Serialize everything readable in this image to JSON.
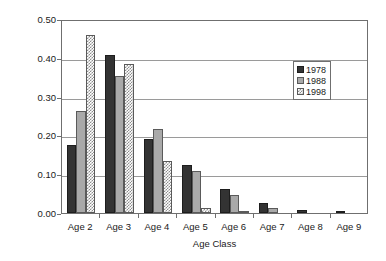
{
  "chart_data": {
    "type": "bar",
    "title": "",
    "xlabel": "Age Class",
    "ylabel": "Proportion",
    "categories": [
      "Age 2",
      "Age 3",
      "Age 4",
      "Age 5",
      "Age 6",
      "Age 7",
      "Age 8",
      "Age 9"
    ],
    "series": [
      {
        "name": "1978",
        "color": "#333333",
        "fill": "solid-dark",
        "values": [
          0.175,
          0.408,
          0.19,
          0.123,
          0.061,
          0.026,
          0.009,
          0.004
        ]
      },
      {
        "name": "1988",
        "color": "#a9a9a9",
        "fill": "solid-gray",
        "values": [
          0.262,
          0.353,
          0.217,
          0.108,
          0.046,
          0.013,
          0.0,
          0.0
        ]
      },
      {
        "name": "1998",
        "color": "#ffffff",
        "fill": "checkered",
        "values": [
          0.46,
          0.383,
          0.135,
          0.012,
          0.003,
          0.0,
          0.0,
          0.0
        ]
      }
    ],
    "ylim": [
      0.0,
      0.5
    ],
    "yticks": [
      0.0,
      0.1,
      0.2,
      0.3,
      0.4,
      0.5
    ],
    "ytick_labels": [
      "0.00",
      "0.10",
      "0.20",
      "0.30",
      "0.40",
      "0.50"
    ],
    "grid": "horizontal",
    "legend_position": "top-right-inside",
    "legend_entries": [
      "1978",
      "1988",
      "1998"
    ]
  }
}
